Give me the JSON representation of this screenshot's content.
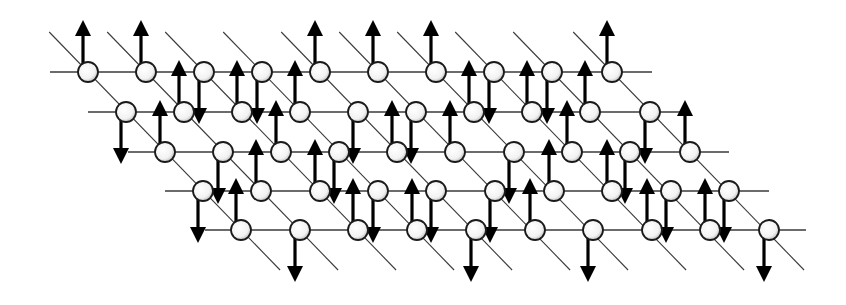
{
  "diagram": {
    "title": "",
    "colors": {
      "background": "#ffffff",
      "line": "#3a3a3a",
      "node_fill": "#f4f4f4",
      "node_stroke": "#1a1a1a",
      "arrow": "#000000"
    },
    "node_radius": 10,
    "arrow": {
      "length": 44,
      "head_len": 16,
      "head_half_width": 8,
      "x_offset": -5
    },
    "diagonal": {
      "dx_per_dy": 0.97,
      "top_y": 32,
      "bottom_y": 270
    },
    "rows": [
      {
        "y": 72,
        "line_x0": 50,
        "line_x1": 652,
        "sites": [
          {
            "x": 88,
            "spin": "up"
          },
          {
            "x": 146,
            "spin": "up"
          },
          {
            "x": 204,
            "spin": "down"
          },
          {
            "x": 262,
            "spin": "down"
          },
          {
            "x": 320,
            "spin": "up"
          },
          {
            "x": 378,
            "spin": "up"
          },
          {
            "x": 436,
            "spin": "up"
          },
          {
            "x": 494,
            "spin": "down"
          },
          {
            "x": 552,
            "spin": "down"
          },
          {
            "x": 612,
            "spin": "up"
          }
        ]
      },
      {
        "y": 112,
        "line_x0": 88,
        "line_x1": 690,
        "sites": [
          {
            "x": 126,
            "spin": "down"
          },
          {
            "x": 184,
            "spin": "up"
          },
          {
            "x": 242,
            "spin": "up"
          },
          {
            "x": 300,
            "spin": "up"
          },
          {
            "x": 358,
            "spin": "down"
          },
          {
            "x": 416,
            "spin": "down"
          },
          {
            "x": 474,
            "spin": "up"
          },
          {
            "x": 532,
            "spin": "up"
          },
          {
            "x": 590,
            "spin": "up"
          },
          {
            "x": 650,
            "spin": "down"
          }
        ]
      },
      {
        "y": 152,
        "line_x0": 128,
        "line_x1": 729,
        "sites": [
          {
            "x": 165,
            "spin": "up"
          },
          {
            "x": 223,
            "spin": "down"
          },
          {
            "x": 281,
            "spin": "up"
          },
          {
            "x": 339,
            "spin": "down"
          },
          {
            "x": 397,
            "spin": "up"
          },
          {
            "x": 455,
            "spin": "up"
          },
          {
            "x": 514,
            "spin": "down"
          },
          {
            "x": 572,
            "spin": "up"
          },
          {
            "x": 630,
            "spin": "down"
          },
          {
            "x": 690,
            "spin": "up"
          }
        ]
      },
      {
        "y": 191,
        "line_x0": 165,
        "line_x1": 769,
        "sites": [
          {
            "x": 203,
            "spin": "down"
          },
          {
            "x": 261,
            "spin": "up"
          },
          {
            "x": 320,
            "spin": "up"
          },
          {
            "x": 378,
            "spin": "down"
          },
          {
            "x": 436,
            "spin": "down"
          },
          {
            "x": 495,
            "spin": "down"
          },
          {
            "x": 554,
            "spin": "up"
          },
          {
            "x": 612,
            "spin": "up"
          },
          {
            "x": 671,
            "spin": "down"
          },
          {
            "x": 729,
            "spin": "down"
          }
        ]
      },
      {
        "y": 230,
        "line_x0": 205,
        "line_x1": 806,
        "sites": [
          {
            "x": 241,
            "spin": "up"
          },
          {
            "x": 300,
            "spin": "down"
          },
          {
            "x": 358,
            "spin": "up"
          },
          {
            "x": 417,
            "spin": "up"
          },
          {
            "x": 476,
            "spin": "down"
          },
          {
            "x": 535,
            "spin": "up"
          },
          {
            "x": 593,
            "spin": "down"
          },
          {
            "x": 652,
            "spin": "up"
          },
          {
            "x": 710,
            "spin": "up"
          },
          {
            "x": 769,
            "spin": "down"
          }
        ]
      }
    ]
  }
}
